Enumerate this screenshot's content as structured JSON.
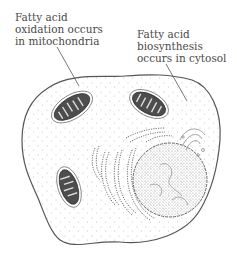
{
  "diagram": {
    "type": "cell-illustration",
    "labels": {
      "oxidation": {
        "lines": [
          "Fatty acid",
          "oxidation occurs",
          "in mitochondria"
        ],
        "points_to": "mitochondrion"
      },
      "biosynthesis": {
        "lines": [
          "Fatty acid",
          "biosynthesis",
          "occurs in cytosol"
        ],
        "points_to": "cytosol"
      }
    },
    "components": [
      "cell-membrane",
      "cytosol",
      "mitochondrion",
      "mitochondrion",
      "mitochondrion",
      "nucleus",
      "endoplasmic-reticulum",
      "golgi-apparatus"
    ],
    "colors": {
      "outline": "#555555",
      "mitochondria_fill": "#4d4d4d",
      "text": "#4a4a4a",
      "stipple": "#b0b0b0"
    }
  }
}
